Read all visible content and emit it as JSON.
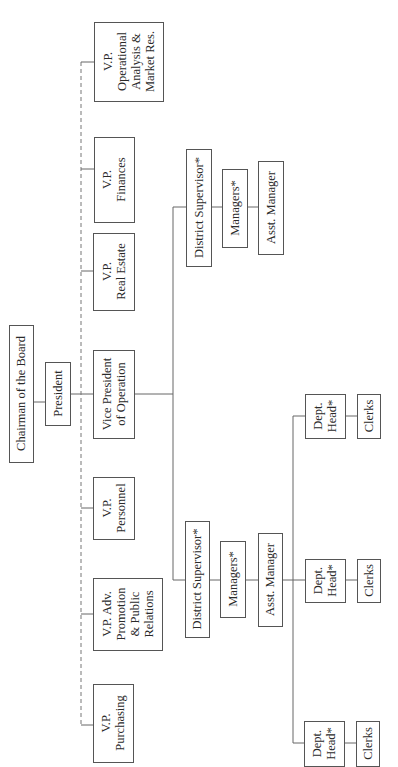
{
  "nodes": {
    "chairman": {
      "lines": [
        "Chairman of the Board"
      ]
    },
    "president": {
      "lines": [
        "President"
      ]
    },
    "vp_operational": {
      "lines": [
        "V.P.",
        "Operational",
        "Analysis &",
        "Market Res."
      ]
    },
    "vp_finances": {
      "lines": [
        "V.P.",
        "Finances"
      ]
    },
    "vp_real_estate": {
      "lines": [
        "V.P.",
        "Real Estate"
      ]
    },
    "vp_operation": {
      "lines": [
        "Vice President",
        "of Operation"
      ]
    },
    "vp_personnel": {
      "lines": [
        "V.P.",
        "Personnel"
      ]
    },
    "vp_adv": {
      "lines": [
        "V.P. Adv.",
        "Promotion",
        "& Public",
        "Relations"
      ]
    },
    "vp_purchasing": {
      "lines": [
        "V.P.",
        "Purchasing"
      ]
    },
    "ds_1": {
      "lines": [
        "District Supervisor*"
      ]
    },
    "mgr_1": {
      "lines": [
        "Managers*"
      ]
    },
    "asst_1": {
      "lines": [
        "Asst. Manager"
      ]
    },
    "ds_2": {
      "lines": [
        "District Supervisor*"
      ]
    },
    "mgr_2": {
      "lines": [
        "Managers*"
      ]
    },
    "asst_2": {
      "lines": [
        "Asst. Manager"
      ]
    },
    "dh_1": {
      "lines": [
        "Dept.",
        "Head*"
      ]
    },
    "clerks_1": {
      "lines": [
        "Clerks"
      ]
    },
    "dh_2": {
      "lines": [
        "Dept.",
        "Head*"
      ]
    },
    "clerks_2": {
      "lines": [
        "Clerks"
      ]
    },
    "dh_3": {
      "lines": [
        "Dept.",
        "Head*"
      ]
    },
    "clerks_3": {
      "lines": [
        "Clerks"
      ]
    }
  },
  "edges": [
    {
      "from": "chairman",
      "to": "president",
      "style": "solid"
    },
    {
      "from": "president",
      "to": "vp_operation",
      "style": "solid"
    },
    {
      "from": "president",
      "to": "vp_operational",
      "style": "dashed"
    },
    {
      "from": "president",
      "to": "vp_finances",
      "style": "dashed"
    },
    {
      "from": "president",
      "to": "vp_real_estate",
      "style": "dashed"
    },
    {
      "from": "president",
      "to": "vp_personnel",
      "style": "dashed"
    },
    {
      "from": "president",
      "to": "vp_adv",
      "style": "dashed"
    },
    {
      "from": "president",
      "to": "vp_purchasing",
      "style": "dashed"
    },
    {
      "from": "vp_operation",
      "to": "ds_1",
      "style": "solid"
    },
    {
      "from": "vp_operation",
      "to": "ds_2",
      "style": "solid"
    },
    {
      "from": "ds_1",
      "to": "mgr_1",
      "style": "solid"
    },
    {
      "from": "mgr_1",
      "to": "asst_1",
      "style": "solid"
    },
    {
      "from": "ds_2",
      "to": "mgr_2",
      "style": "solid"
    },
    {
      "from": "mgr_2",
      "to": "asst_2",
      "style": "solid"
    },
    {
      "from": "asst_2",
      "to": "dh_1",
      "style": "solid"
    },
    {
      "from": "asst_2",
      "to": "dh_2",
      "style": "solid"
    },
    {
      "from": "asst_2",
      "to": "dh_3",
      "style": "solid"
    },
    {
      "from": "dh_1",
      "to": "clerks_1",
      "style": "solid"
    },
    {
      "from": "dh_2",
      "to": "clerks_2",
      "style": "solid"
    },
    {
      "from": "dh_3",
      "to": "clerks_3",
      "style": "solid"
    }
  ]
}
